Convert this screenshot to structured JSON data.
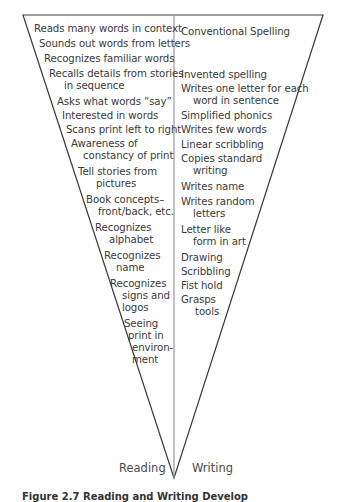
{
  "diagram": {
    "reading_label": "Reading",
    "writing_label": "Writing",
    "reading_items": [
      {
        "line1": "Reads many words in context",
        "line2": ""
      },
      {
        "line1": "Sounds out words from letters",
        "line2": ""
      },
      {
        "line1": "Recognizes familiar words",
        "line2": ""
      },
      {
        "line1": "Recalls details from stories",
        "line2": "in sequence"
      },
      {
        "line1": "Asks what words “say”",
        "line2": ""
      },
      {
        "line1": "Interested in words",
        "line2": ""
      },
      {
        "line1": "Scans print left to right",
        "line2": ""
      },
      {
        "line1": "Awareness of",
        "line2": "constancy of print"
      },
      {
        "line1": "Tell stories from",
        "line2": "pictures"
      },
      {
        "line1": "Book concepts–",
        "line2": "front/back, etc."
      },
      {
        "line1": "Recognizes",
        "line2": "alphabet"
      },
      {
        "line1": "Recognizes",
        "line2": "name"
      },
      {
        "line1": "Recognizes",
        "line2": "signs and",
        "line3": "logos"
      },
      {
        "line1": "Seeing",
        "line2": "print in",
        "line3": "environ-",
        "line4": "ment"
      }
    ],
    "writing_items": [
      {
        "line1": "Conventional Spelling",
        "line2": ""
      },
      {
        "line1": "Invented spelling",
        "line2": ""
      },
      {
        "line1": "Writes one letter for each",
        "line2": "word in sentence"
      },
      {
        "line1": "Simplified phonics",
        "line2": ""
      },
      {
        "line1": "Writes few words",
        "line2": ""
      },
      {
        "line1": "Linear scribbling",
        "line2": ""
      },
      {
        "line1": "Copies standard",
        "line2": "writing"
      },
      {
        "line1": "Writes name",
        "line2": ""
      },
      {
        "line1": "Writes random",
        "line2": "letters"
      },
      {
        "line1": "Letter like",
        "line2": "form in art"
      },
      {
        "line1": "Drawing",
        "line2": ""
      },
      {
        "line1": "Scribbling",
        "line2": ""
      },
      {
        "line1": "Fist hold",
        "line2": ""
      },
      {
        "line1": "Grasps",
        "line2": "tools"
      }
    ],
    "caption": "Figure 2.7 Reading and Writing Develop"
  },
  "colors": {
    "outline": "#3a3a3a",
    "divider": "#9a9a9a",
    "text": "#3a3a3a"
  }
}
